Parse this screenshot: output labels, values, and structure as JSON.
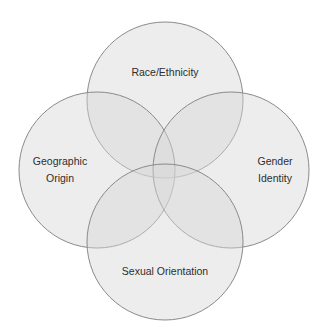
{
  "diagram": {
    "type": "venn",
    "title": "",
    "circles": [
      {
        "id": "top",
        "label": "Race/Ethnicity",
        "lines": [
          "Race/Ethnicity"
        ],
        "cx": 165,
        "cy": 100,
        "r": 78
      },
      {
        "id": "left",
        "label": "Geographic Origin",
        "lines": [
          "Geographic",
          "Origin"
        ],
        "cx": 97,
        "cy": 170,
        "r": 78
      },
      {
        "id": "right",
        "label": "Gender Identity",
        "lines": [
          "Gender",
          "Identity"
        ],
        "cx": 231,
        "cy": 170,
        "r": 78
      },
      {
        "id": "bottom",
        "label": "Sexual Orientation",
        "lines": [
          "Sexual Orientation"
        ],
        "cx": 165,
        "cy": 242,
        "r": 78
      }
    ],
    "colors": {
      "fill": "#d8d8d8",
      "stroke": "#8a8a8a",
      "text": "#2e2e2e",
      "background": "#ffffff"
    }
  }
}
